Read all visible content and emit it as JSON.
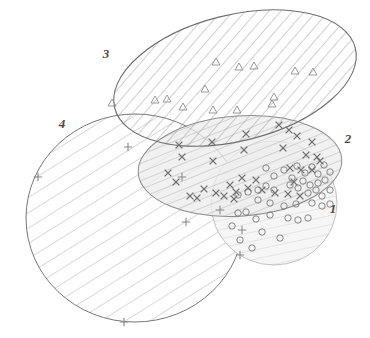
{
  "figure": {
    "type": "venn-ellipse-diagram",
    "width": 370,
    "height": 338,
    "background": "#ffffff"
  },
  "labels": [
    {
      "id": "label-1",
      "text": "1",
      "x": 333,
      "y": 213,
      "style": "italic-bold"
    },
    {
      "id": "label-2",
      "text": "2",
      "x": 348,
      "y": 143,
      "style": "italic-bold"
    },
    {
      "id": "label-3",
      "text": "3",
      "x": 106,
      "y": 58,
      "style": "italic-bold"
    },
    {
      "id": "label-4",
      "text": "4",
      "x": 62,
      "y": 128,
      "style": "italic-bold"
    }
  ],
  "colors": {
    "outline": "#6b6b6b",
    "hatch_light": "#b9b9b9",
    "hatch_mid": "#9a9a9a",
    "hatch_dark": "#8a8a8a",
    "marker_circle": "#7a7a7a",
    "marker_cross": "#6e6e6e",
    "marker_triangle": "#8e8e8e",
    "marker_plus": "#8a8a8a",
    "label": "#4a4a4a"
  },
  "ellipses": [
    {
      "id": "ellipse-1",
      "label": "1",
      "cx": 274,
      "cy": 203,
      "rx": 63,
      "ry": 62,
      "rotate": 0,
      "hatch": "near-vertical",
      "hatch_angle": 78,
      "hatch_color": "#c6c6c6",
      "fill": "#f4f4f4",
      "marker": "circle"
    },
    {
      "id": "ellipse-2",
      "label": "2",
      "cx": 240,
      "cy": 166,
      "rx": 102,
      "ry": 50,
      "rotate": -4,
      "hatch": "steep-diagonal",
      "hatch_angle": 72,
      "hatch_color": "#b0b0b0",
      "fill": "#ededed",
      "marker": "cross"
    },
    {
      "id": "ellipse-3",
      "label": "3",
      "cx": 235,
      "cy": 78,
      "rx": 124,
      "ry": 63,
      "rotate": -14,
      "hatch": "diagonal",
      "hatch_angle": 55,
      "hatch_color": "#9e9e9e",
      "fill": "none",
      "marker": "triangle"
    },
    {
      "id": "ellipse-4",
      "label": "4",
      "cx": 135,
      "cy": 218,
      "rx": 109,
      "ry": 104,
      "rotate": 0,
      "hatch": "diagonal",
      "hatch_angle": 58,
      "hatch_color": "#a8a8a8",
      "fill": "none",
      "marker": "plus"
    }
  ],
  "markers": {
    "triangle": {
      "symbol": "triangle",
      "belongs_to": "ellipse-3",
      "points": [
        [
          112,
          103
        ],
        [
          155,
          100
        ],
        [
          167,
          99
        ],
        [
          205,
          89
        ],
        [
          216,
          62
        ],
        [
          239,
          67
        ],
        [
          254,
          66
        ],
        [
          274,
          97
        ],
        [
          295,
          71
        ],
        [
          313,
          72
        ],
        [
          272,
          104
        ],
        [
          213,
          110
        ],
        [
          183,
          107
        ],
        [
          237,
          110
        ]
      ]
    },
    "cross": {
      "symbol": "x-cross",
      "belongs_to": "ellipse-2",
      "points": [
        [
          179,
          145
        ],
        [
          212,
          142
        ],
        [
          182,
          157
        ],
        [
          213,
          161
        ],
        [
          244,
          150
        ],
        [
          246,
          134
        ],
        [
          279,
          125
        ],
        [
          289,
          130
        ],
        [
          297,
          136
        ],
        [
          283,
          148
        ],
        [
          312,
          142
        ],
        [
          306,
          155
        ],
        [
          317,
          157
        ],
        [
          320,
          161
        ],
        [
          290,
          168
        ],
        [
          301,
          170
        ],
        [
          312,
          170
        ],
        [
          294,
          182
        ],
        [
          256,
          180
        ],
        [
          242,
          178
        ],
        [
          230,
          185
        ],
        [
          236,
          192
        ],
        [
          248,
          188
        ],
        [
          262,
          190
        ],
        [
          275,
          193
        ],
        [
          288,
          194
        ],
        [
          300,
          196
        ],
        [
          224,
          196
        ],
        [
          234,
          199
        ],
        [
          216,
          193
        ],
        [
          204,
          189
        ],
        [
          197,
          198
        ],
        [
          190,
          196
        ],
        [
          176,
          182
        ],
        [
          168,
          173
        ]
      ]
    },
    "circle": {
      "symbol": "circle",
      "belongs_to": "ellipse-1",
      "points": [
        [
          266,
          168
        ],
        [
          274,
          176
        ],
        [
          284,
          170
        ],
        [
          292,
          178
        ],
        [
          297,
          166
        ],
        [
          305,
          173
        ],
        [
          312,
          167
        ],
        [
          318,
          174
        ],
        [
          324,
          165
        ],
        [
          330,
          172
        ],
        [
          303,
          181
        ],
        [
          310,
          185
        ],
        [
          318,
          183
        ],
        [
          325,
          180
        ],
        [
          290,
          185
        ],
        [
          298,
          188
        ],
        [
          266,
          186
        ],
        [
          274,
          190
        ],
        [
          258,
          190
        ],
        [
          248,
          192
        ],
        [
          238,
          195
        ],
        [
          308,
          193
        ],
        [
          316,
          190
        ],
        [
          322,
          196
        ],
        [
          330,
          190
        ],
        [
          258,
          200
        ],
        [
          270,
          203
        ],
        [
          284,
          206
        ],
        [
          296,
          204
        ],
        [
          312,
          203
        ],
        [
          322,
          206
        ],
        [
          330,
          204
        ],
        [
          246,
          212
        ],
        [
          256,
          219
        ],
        [
          270,
          215
        ],
        [
          288,
          218
        ],
        [
          298,
          220
        ],
        [
          308,
          218
        ],
        [
          232,
          226
        ],
        [
          240,
          240
        ],
        [
          262,
          232
        ],
        [
          280,
          238
        ],
        [
          252,
          248
        ],
        [
          238,
          213
        ]
      ]
    },
    "plus": {
      "symbol": "plus",
      "belongs_to": "ellipse-4",
      "points": [
        [
          38,
          177
        ],
        [
          128,
          147
        ],
        [
          182,
          177
        ],
        [
          186,
          222
        ],
        [
          242,
          230
        ],
        [
          124,
          322
        ],
        [
          240,
          255
        ],
        [
          220,
          210
        ]
      ]
    }
  }
}
